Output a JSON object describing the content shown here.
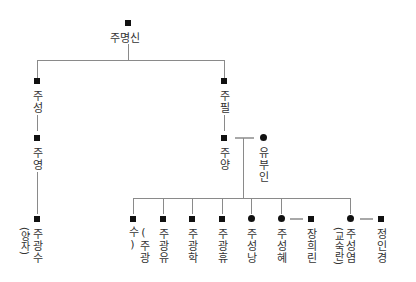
{
  "diagram": {
    "type": "family-tree",
    "legend_semantics": {
      "square": "male",
      "circle": "female",
      "double-gray-line": "marriage"
    },
    "root": {
      "name": "주명신",
      "sex": "male"
    },
    "generation2": [
      {
        "name": "주성",
        "sex": "male"
      },
      {
        "name": "주필",
        "sex": "male"
      }
    ],
    "generation3": [
      {
        "name": "주영",
        "sex": "male",
        "parent": "주성"
      },
      {
        "name": "주양",
        "sex": "male",
        "parent": "주필",
        "spouse": "유부인"
      }
    ],
    "spouse_yu": {
      "name": "유부인",
      "sex": "female"
    },
    "adopted": {
      "name": "주광수",
      "note": "(양자)",
      "sex": "male",
      "parent": "주영"
    },
    "children": [
      {
        "name": "(주광수)",
        "sex": "male"
      },
      {
        "name": "주광유",
        "sex": "male"
      },
      {
        "name": "주광학",
        "sex": "male"
      },
      {
        "name": "주광휴",
        "sex": "male"
      },
      {
        "name": "주성낭",
        "sex": "female"
      },
      {
        "name": "주성혜",
        "sex": "female",
        "spouse": "장희린"
      },
      {
        "name": "주성염",
        "note": "(교숙란)",
        "sex": "female",
        "spouse": "정인경"
      }
    ],
    "children_spouses": [
      {
        "name": "장희린",
        "sex": "male"
      },
      {
        "name": "정인경",
        "sex": "male"
      }
    ]
  }
}
